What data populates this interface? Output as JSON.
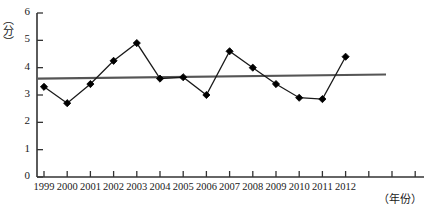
{
  "chart_data": {
    "type": "line",
    "title": "",
    "xlabel": "（年份）",
    "ylabel": "（分）",
    "categories": [
      "1999",
      "2000",
      "2001",
      "2002",
      "2003",
      "2004",
      "2005",
      "2006",
      "2007",
      "2008",
      "2009",
      "2010",
      "2011",
      "2012"
    ],
    "values": [
      3.3,
      2.7,
      3.4,
      4.25,
      4.9,
      3.6,
      3.65,
      3.0,
      4.6,
      4.0,
      3.4,
      2.9,
      2.85,
      4.4
    ],
    "series": [
      {
        "name": "score",
        "marker": "diamond",
        "values": [
          3.3,
          2.7,
          3.4,
          4.25,
          4.9,
          3.6,
          3.65,
          3.0,
          4.6,
          4.0,
          3.4,
          2.9,
          2.85,
          4.4
        ]
      },
      {
        "name": "trend-line",
        "marker": "none",
        "endpoints": [
          3.6,
          3.75
        ]
      }
    ],
    "ylim": [
      0,
      6
    ],
    "yticks": [
      0,
      1,
      2,
      3,
      4,
      5,
      6
    ],
    "ytick_labels": [
      "0",
      "1",
      "2",
      "3",
      "4",
      "5",
      "6"
    ],
    "grid": false,
    "legend": "none",
    "colors": {
      "line": "#1a1a1a",
      "marker": "#000000",
      "trend": "#555555",
      "axis": "#333333"
    }
  }
}
